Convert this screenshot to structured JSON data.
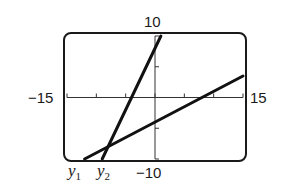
{
  "chart_data": {
    "type": "line",
    "title": "",
    "xlabel": "",
    "ylabel": "",
    "xlim": [
      -15,
      15
    ],
    "ylim": [
      -10,
      10
    ],
    "x_tick_step": 5,
    "y_tick_step": 5,
    "grid": false,
    "window_labels": {
      "xmin": "−15",
      "xmax": "15",
      "ymax": "10",
      "ymin": "−10"
    },
    "series": [
      {
        "name": "y1",
        "label_base": "y",
        "label_sub": "1",
        "equation": "y = 0.5x - 4",
        "slope": 0.5,
        "intercept": -4,
        "points": [
          [
            -12,
            -10
          ],
          [
            15,
            3.5
          ]
        ]
      },
      {
        "name": "y2",
        "label_base": "y",
        "label_sub": "2",
        "equation": "y = 2x + 8",
        "slope": 2,
        "intercept": 8,
        "points": [
          [
            -9,
            -10
          ],
          [
            1,
            10
          ]
        ]
      }
    ],
    "intersection": [
      -8,
      -8
    ]
  }
}
